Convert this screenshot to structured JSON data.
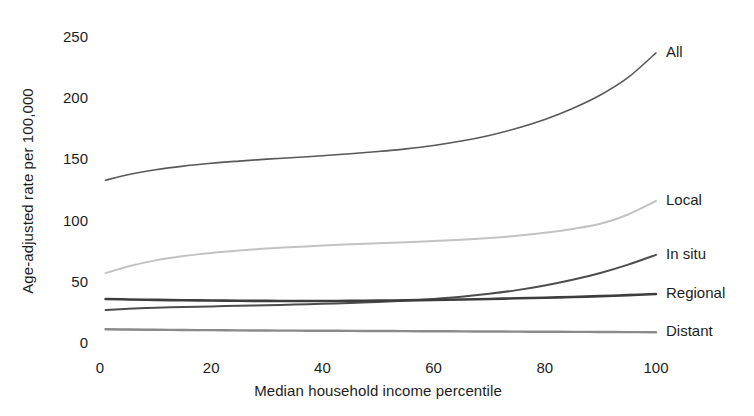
{
  "chart_data": {
    "type": "line",
    "title": "",
    "xlabel": "Median household income percentile",
    "ylabel": "Age-adjusted rate per 100,000",
    "xlim": [
      0,
      100
    ],
    "ylim": [
      0,
      250
    ],
    "grid": false,
    "legend_position": "right-end-labels",
    "xticks": [
      "0",
      "20",
      "40",
      "60",
      "80",
      "100"
    ],
    "xtick_values": [
      0,
      20,
      40,
      60,
      80,
      100
    ],
    "yticks": [
      "0",
      "50",
      "100",
      "150",
      "200",
      "250"
    ],
    "ytick_values": [
      0,
      50,
      100,
      150,
      200,
      250
    ],
    "x": [
      1,
      5,
      10,
      15,
      20,
      25,
      30,
      35,
      40,
      45,
      50,
      55,
      60,
      65,
      70,
      75,
      80,
      85,
      90,
      95,
      100
    ],
    "series": [
      {
        "name": "All",
        "color": "#595959",
        "width": 1.6,
        "label_x": 100,
        "label_y": 237,
        "values": [
          133,
          137.5,
          141.5,
          144.5,
          146.8,
          148.6,
          150.2,
          151.6,
          153.0,
          154.6,
          156.4,
          158.6,
          161.4,
          165.0,
          169.6,
          175.4,
          182.6,
          191.6,
          202.6,
          217.0,
          237.0
        ]
      },
      {
        "name": "Local",
        "color": "#c2c2c2",
        "width": 2.0,
        "label_x": 100,
        "label_y": 116,
        "values": [
          57,
          62.5,
          67.5,
          71.0,
          73.6,
          75.6,
          77.2,
          78.5,
          79.6,
          80.6,
          81.5,
          82.4,
          83.3,
          84.4,
          85.8,
          87.6,
          90.0,
          93.2,
          97.4,
          105.0,
          116.0
        ]
      },
      {
        "name": "In situ",
        "color": "#4d4d4d",
        "width": 2.0,
        "label_x": 100,
        "label_y": 72,
        "values": [
          27,
          28.0,
          28.8,
          29.4,
          29.9,
          30.4,
          30.9,
          31.4,
          32.0,
          32.7,
          33.5,
          34.6,
          36.0,
          37.8,
          40.2,
          43.2,
          47.0,
          51.6,
          57.2,
          64.0,
          72.0
        ]
      },
      {
        "name": "Regional",
        "color": "#3d3d3d",
        "width": 2.6,
        "label_x": 100,
        "label_y": 40,
        "values": [
          36.0,
          35.6,
          35.2,
          34.9,
          34.7,
          34.5,
          34.4,
          34.3,
          34.3,
          34.4,
          34.6,
          34.9,
          35.2,
          35.6,
          36.0,
          36.5,
          37.0,
          37.6,
          38.3,
          39.1,
          40.0
        ]
      },
      {
        "name": "Distant",
        "color": "#8a8a8a",
        "width": 2.4,
        "label_x": 100,
        "label_y": 9,
        "values": [
          11.2,
          11.0,
          10.8,
          10.6,
          10.5,
          10.3,
          10.2,
          10.1,
          10.0,
          9.9,
          9.8,
          9.7,
          9.6,
          9.5,
          9.4,
          9.3,
          9.2,
          9.1,
          9.0,
          8.9,
          8.8
        ]
      }
    ]
  },
  "axes": {
    "y_title": "Age-adjusted rate per 100,000",
    "x_title": "Median household income percentile"
  }
}
